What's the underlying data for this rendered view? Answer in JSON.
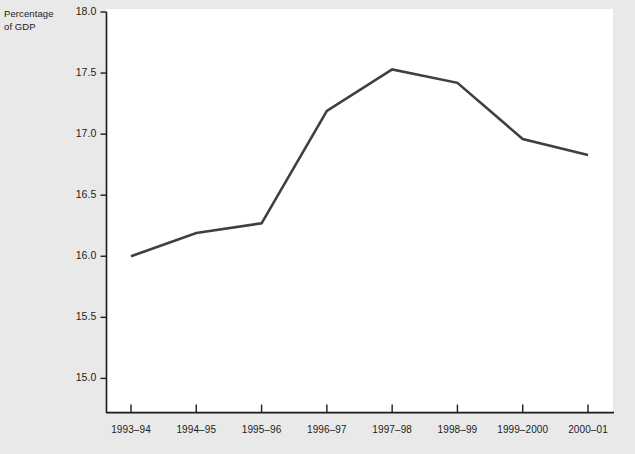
{
  "chart_data": {
    "type": "line",
    "title": "",
    "subtitle": "",
    "xlabel": "",
    "ylabel": "Percentage\nof GDP",
    "ylabel_line1": "Percentage",
    "ylabel_line2": "of GDP",
    "categories": [
      "1993–94",
      "1994–95",
      "1995–96",
      "1996–97",
      "1997–98",
      "1998–99",
      "1999–2000",
      "2000–01"
    ],
    "values": [
      16.0,
      16.19,
      16.27,
      17.19,
      17.53,
      17.42,
      16.96,
      16.83
    ],
    "series": [
      {
        "name": "Percentage of GDP",
        "values": [
          16.0,
          16.19,
          16.27,
          17.19,
          17.53,
          17.42,
          16.96,
          16.83
        ]
      }
    ],
    "yticks": [
      15.0,
      15.5,
      16.0,
      16.5,
      17.0,
      17.5,
      18.0
    ],
    "ytick_labels": [
      "15.0",
      "15.5",
      "16.0",
      "16.5",
      "17.0",
      "17.5",
      "18.0"
    ],
    "ylim": [
      14.72,
      18.0
    ],
    "grid": false,
    "legend": false,
    "legend_position": "none",
    "line_color": "#3f3f3f",
    "axis_color": "#1b1b1b",
    "plot_background": "#ffffff",
    "page_background": "#e9e9e9"
  }
}
